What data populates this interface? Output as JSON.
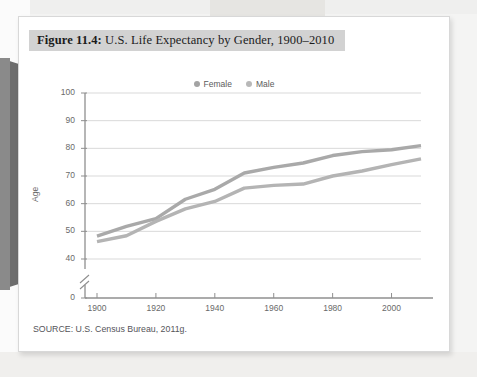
{
  "figure": {
    "label": "Figure 11.4:",
    "title": " U.S. Life Expectancy by Gender, 1900–2010",
    "source": "SOURCE: U.S. Census Bureau, 2011g."
  },
  "colors": {
    "female_line": "#a9a9a9",
    "male_line": "#b4b4b4",
    "grid": "#d9d9d9",
    "axis": "#8f8f8f",
    "title_band": "#d2d2d2",
    "tick_text": "#6a6a6a"
  },
  "chart_data": {
    "type": "line",
    "title": "Figure 11.4: U.S. Life Expectancy by Gender, 1900–2010",
    "xlabel": "",
    "ylabel": "Age",
    "xlim": [
      1900,
      2013
    ],
    "ylim": [
      40,
      100
    ],
    "y_axis_break": true,
    "y_zero_tick": "0",
    "grid": true,
    "legend_position": "top-center",
    "xticks": [
      "1900",
      "1920",
      "1940",
      "1960",
      "1980",
      "2000"
    ],
    "xtick_values": [
      1900,
      1920,
      1940,
      1960,
      1980,
      2000
    ],
    "yticks": [
      "0",
      "40",
      "50",
      "60",
      "70",
      "80",
      "90",
      "100"
    ],
    "ytick_values": [
      0,
      40,
      50,
      60,
      70,
      80,
      90,
      100
    ],
    "x": [
      1900,
      1910,
      1920,
      1930,
      1940,
      1950,
      1960,
      1970,
      1980,
      1990,
      2000,
      2010
    ],
    "series": [
      {
        "name": "Female",
        "color": "#a9a9a9",
        "values": [
          48.3,
          51.8,
          54.6,
          61.6,
          65.2,
          71.1,
          73.1,
          74.7,
          77.4,
          78.8,
          79.5,
          81.0
        ]
      },
      {
        "name": "Male",
        "color": "#b4b4b4",
        "values": [
          46.3,
          48.4,
          53.6,
          58.1,
          60.8,
          65.6,
          66.6,
          67.1,
          70.0,
          71.8,
          74.1,
          76.2
        ]
      }
    ]
  }
}
